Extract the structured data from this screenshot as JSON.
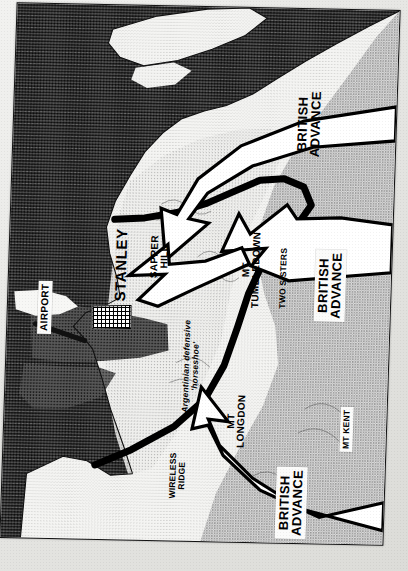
{
  "document": {
    "kind": "scanned-map-photo",
    "subject": "Falklands War — British advance on Stanley",
    "orientation_note": "map plate printed rotated 90 degrees; all place labels read bottom-to-top"
  },
  "map": {
    "title_labels": {
      "advance_north": "BRITISH\nADVANCE",
      "advance_centre": "BRITISH\nADVANCE",
      "advance_south": "BRITISH\nADVANCE"
    },
    "places": [
      {
        "id": "airport",
        "name": "AIRPORT",
        "style": "box"
      },
      {
        "id": "stanley",
        "name": "STANLEY",
        "style": "plain"
      },
      {
        "id": "sapper-hill",
        "name": "SAPPER\nHILL",
        "style": "plain"
      },
      {
        "id": "tumbledown",
        "name": "MT\nTUMBLEDOWN",
        "style": "plain"
      },
      {
        "id": "two-sisters",
        "name": "TWO SISTERS",
        "style": "plain"
      },
      {
        "id": "longdon",
        "name": "MT\nLONGDON",
        "style": "plain"
      },
      {
        "id": "wireless",
        "name": "WIRELESS\nRIDGE",
        "style": "plain"
      },
      {
        "id": "mt-kent",
        "name": "MT KENT",
        "style": "box"
      }
    ],
    "annotations": [
      {
        "id": "horseshoe",
        "text": "Argentinian defensive\n'horseshoe'"
      }
    ],
    "legend_colors": {
      "sea": "#4e4e4e",
      "land": "#f4f4f2",
      "high_ground": "#b9b9b9",
      "defensive_line": "#000000",
      "arrow_fill": "#ffffff",
      "arrow_stroke": "#000000",
      "paper": "#e8e8e6"
    }
  }
}
